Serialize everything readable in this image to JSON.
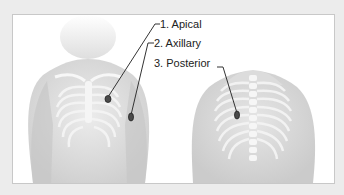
{
  "figure": {
    "type": "anatomical-diagram",
    "views": [
      "anterior-chest",
      "posterior-back"
    ],
    "labels": [
      {
        "id": "apical",
        "text": "1. Apical"
      },
      {
        "id": "axillary",
        "text": "2. Axillary"
      },
      {
        "id": "posterior",
        "text": "3. Posterior"
      }
    ],
    "colors": {
      "background": "#ececec",
      "panel": "#ffffff",
      "skin": "#d9d9d9",
      "ribs": "#f5f5f5",
      "leader_line": "#333333",
      "electrode": "#4a4a4a"
    }
  }
}
